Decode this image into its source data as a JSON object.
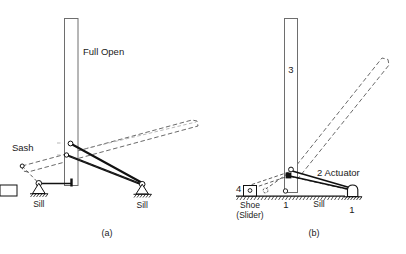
{
  "figure": {
    "type": "kinematic-diagram",
    "background_color": "#ffffff",
    "line_color": "#1a1a1a",
    "dashed_color": "#3a3a3a",
    "panels": [
      {
        "id": "a",
        "caption": "(a)",
        "labels": {
          "full_open": "Full Open",
          "sash": "Sash",
          "sill_left": "Sill",
          "sill_right": "Sill"
        }
      },
      {
        "id": "b",
        "caption": "(b)",
        "labels": {
          "link_3": "3",
          "link_2": "2 Actuator",
          "link_4": "4",
          "shoe_line1": "Shoe",
          "shoe_line2": "(Slider)",
          "ground_1_center": "1",
          "ground_1_right": "1",
          "sill": "Sill"
        }
      }
    ]
  }
}
